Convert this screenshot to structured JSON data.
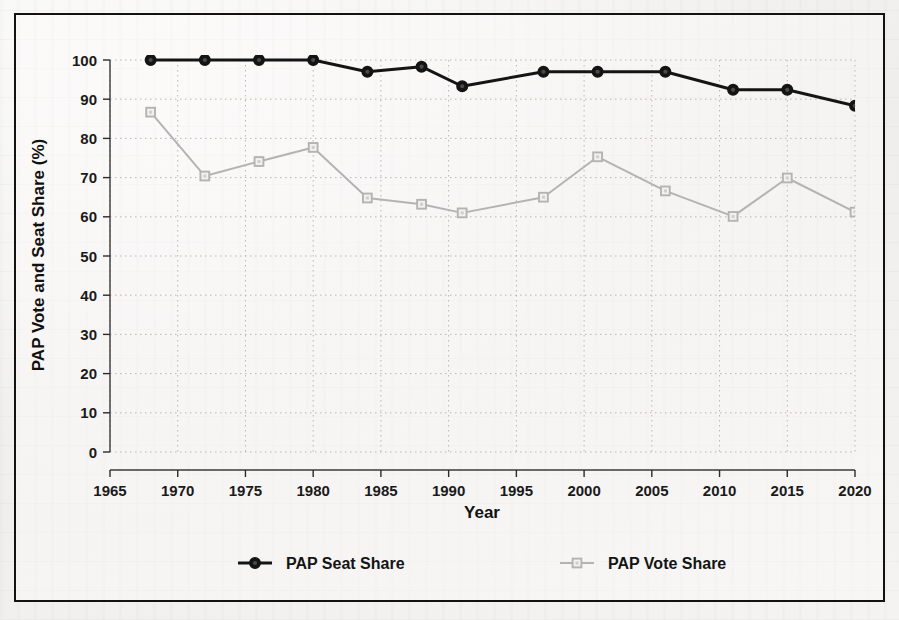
{
  "figure": {
    "frame_color": "#121212",
    "paper_color": "#f3f2f0"
  },
  "chart_data": {
    "type": "line",
    "title": "",
    "xlabel": "Year",
    "ylabel": "PAP Vote and Seat Share (%)",
    "xlim": [
      1965,
      2020
    ],
    "ylim": [
      0,
      100
    ],
    "grid": true,
    "legend_position": "bottom",
    "x_ticks": [
      1965,
      1970,
      1975,
      1980,
      1985,
      1990,
      1995,
      2000,
      2005,
      2010,
      2015,
      2020
    ],
    "y_ticks": [
      0,
      10,
      20,
      30,
      40,
      50,
      60,
      70,
      80,
      90,
      100
    ],
    "x": [
      1968,
      1972,
      1976,
      1980,
      1984,
      1988,
      1991,
      1997,
      2001,
      2006,
      2011,
      2015,
      2020
    ],
    "series": [
      {
        "name": "PAP Seat Share",
        "color": "#141414",
        "marker": "circle-filled",
        "line_width": 3,
        "values": [
          100.0,
          100.0,
          100.0,
          100.0,
          97.0,
          98.3,
          93.3,
          97.0,
          97.0,
          97.0,
          92.4,
          92.4,
          88.3
        ]
      },
      {
        "name": "PAP Vote Share",
        "color": "#b3b3b3",
        "marker": "square-open",
        "line_width": 2,
        "values": [
          86.7,
          70.4,
          74.1,
          77.7,
          64.8,
          63.2,
          61.0,
          65.0,
          75.3,
          66.6,
          60.1,
          69.9,
          61.2
        ]
      }
    ]
  },
  "axes": {
    "x_title": "Year",
    "y_title": "PAP Vote and Seat Share (%)",
    "x_tick_labels": [
      "1965",
      "1970",
      "1975",
      "1980",
      "1985",
      "1990",
      "1995",
      "2000",
      "2005",
      "2010",
      "2015",
      "2020"
    ],
    "y_tick_labels": [
      "0",
      "10",
      "20",
      "30",
      "40",
      "50",
      "60",
      "70",
      "80",
      "90",
      "100"
    ]
  },
  "legend": {
    "entries": [
      {
        "label": "PAP Seat Share",
        "marker": "circle-filled",
        "color": "#141414"
      },
      {
        "label": "PAP Vote Share",
        "marker": "square-open",
        "color": "#b3b3b3"
      }
    ]
  }
}
